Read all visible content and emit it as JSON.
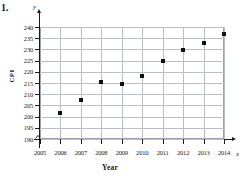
{
  "question_number": "1.",
  "axis_symbols": {
    "y": "y",
    "x": "x"
  },
  "chart_data": {
    "type": "scatter",
    "title": "",
    "xlabel": "Year",
    "ylabel": "CPI",
    "xlim": [
      2005,
      2014
    ],
    "ylim": [
      190,
      240
    ],
    "grid": true,
    "legend": "none",
    "axis_break_y": true,
    "x_tick_labels": [
      "2005",
      "2006",
      "2007",
      "2008",
      "2009",
      "2010",
      "2011",
      "2012",
      "2013",
      "2014"
    ],
    "y_tick_labels": [
      "190",
      "195",
      "200",
      "205",
      "210",
      "215",
      "220",
      "225",
      "230",
      "235",
      "240"
    ],
    "x": [
      2006,
      2007,
      2008,
      2009,
      2010,
      2011,
      2012,
      2013,
      2014
    ],
    "values": [
      201.6,
      207.3,
      215.3,
      214.5,
      218.1,
      224.9,
      229.6,
      233.0,
      236.7
    ],
    "point_color": "#101010",
    "grid_color": "#b9bfc9",
    "axis_color": "#1a1a1a"
  }
}
